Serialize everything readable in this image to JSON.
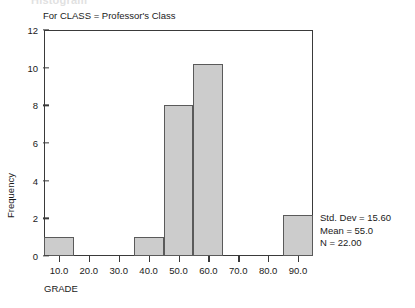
{
  "figure": {
    "clipped_header": "Histogram",
    "subtitle": "For CLASS = Professor's Class"
  },
  "stats": {
    "std_dev": "Std. Dev = 15.60",
    "mean": "Mean = 55.0",
    "n": "N = 22.00"
  },
  "colors": {
    "bar_fill": "#cccccc",
    "bar_edge": "#5a5a5a",
    "frame": "#3a3a3a",
    "text": "#1a1a1a"
  },
  "chart_data": {
    "type": "bar",
    "title": "Histogram",
    "subtitle": "For CLASS = Professor's Class",
    "xlabel": "GRADE",
    "ylabel": "Frequency",
    "xlim": [
      5,
      95
    ],
    "ylim": [
      0,
      12
    ],
    "grid": false,
    "legend": "none",
    "xticks": [
      10,
      20,
      30,
      40,
      50,
      60,
      70,
      80,
      90
    ],
    "xtick_labels": [
      "10.0",
      "20.0",
      "30.0",
      "40.0",
      "50.0",
      "60.0",
      "70.0",
      "80.0",
      "90.0"
    ],
    "yticks": [
      0,
      2,
      4,
      6,
      8,
      10,
      12
    ],
    "ytick_labels": [
      "0",
      "2",
      "4",
      "6",
      "8",
      "10",
      "12"
    ],
    "bin_width": 10,
    "bins": [
      {
        "left": 5,
        "right": 15,
        "center": 10,
        "value": 1
      },
      {
        "left": 35,
        "right": 45,
        "center": 40,
        "value": 1
      },
      {
        "left": 45,
        "right": 55,
        "center": 50,
        "value": 8
      },
      {
        "left": 55,
        "right": 65,
        "center": 60,
        "value": 10.2
      },
      {
        "left": 85,
        "right": 95,
        "center": 90,
        "value": 2.2
      }
    ],
    "categories": [
      "10.0",
      "40.0",
      "50.0",
      "60.0",
      "90.0"
    ],
    "values": [
      1,
      1,
      8,
      10.2,
      2.2
    ],
    "annotations": [
      "Std. Dev = 15.60",
      "Mean = 55.0",
      "N = 22.00"
    ]
  }
}
